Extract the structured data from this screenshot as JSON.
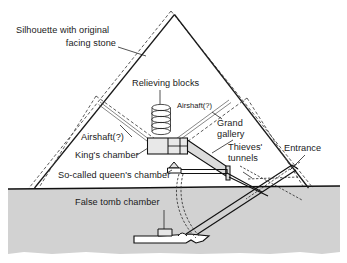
{
  "figure": {
    "kind": "cross-section-diagram",
    "background_color": "#ffffff",
    "ink_color": "#1a1a1a"
  },
  "colors": {
    "bedrock_fill": "#d2d2d2",
    "chamber_fill": "#e8e8e8",
    "gallery_fill": "#dcdcdc",
    "outline": "#111111",
    "silhouette_dash": "#4a4a4a",
    "text": "#1a1a1a"
  },
  "labels": {
    "silhouette": {
      "line1": "Silhouette with original",
      "line2": "facing stone"
    },
    "relieving_blocks": "Relieving blocks",
    "airshaft_upper": "Airshaft(?)",
    "airshaft_left": "Airshaft(?)",
    "grand_gallery": {
      "line1": "Grand",
      "line2": "gallery"
    },
    "thieves_tunnels": {
      "line1": "Thieves'",
      "line2": "tunnels"
    },
    "entrance": "Entrance",
    "kings_chamber": "King's chamber",
    "queens_chamber": "So-called queen's chamber",
    "false_tomb_chamber": "False tomb chamber"
  },
  "features": [
    {
      "id": "silhouette",
      "name": "Silhouette with original facing stone",
      "style": "dashed outline"
    },
    {
      "id": "relieving-blocks",
      "name": "Relieving blocks",
      "count": 5,
      "style": "stacked lens shapes"
    },
    {
      "id": "airshaft-upper-right",
      "name": "Airshaft(?)",
      "style": "thin double line"
    },
    {
      "id": "airshaft-upper-left",
      "name": "Airshaft(?)",
      "style": "thin double line"
    },
    {
      "id": "kings-chamber",
      "name": "King's chamber",
      "style": "filled rectangle with internal cells"
    },
    {
      "id": "grand-gallery",
      "name": "Grand gallery",
      "style": "inclined filled corridor"
    },
    {
      "id": "queens-chamber",
      "name": "So-called queen's chamber",
      "style": "small gabled chamber"
    },
    {
      "id": "thieves-tunnels",
      "name": "Thieves' tunnels",
      "style": "dashed crossing lines"
    },
    {
      "id": "entrance",
      "name": "Entrance",
      "style": "opening on north face"
    },
    {
      "id": "false-tomb-chamber",
      "name": "False tomb chamber",
      "style": "subterranean cavity"
    }
  ]
}
